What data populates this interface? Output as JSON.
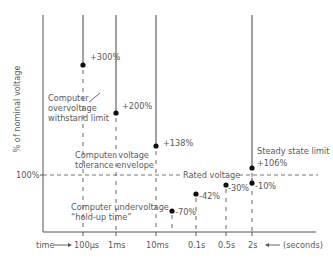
{
  "diagram": {
    "y_axis_label": "% of nominal voltage",
    "y_reference_label": "100%",
    "rated_voltage_label": "Rated voltage",
    "x_axis": {
      "prefix": "time",
      "suffix": "(seconds)",
      "ticks": [
        "100μs",
        "1ms",
        "10ms",
        "0.1s",
        "0.5s",
        "2s"
      ]
    },
    "overvoltage_points": [
      {
        "time": "100μs",
        "label": "+300%"
      },
      {
        "time": "1ms",
        "label": "+200%"
      },
      {
        "time": "10ms",
        "label": "+138%"
      },
      {
        "time": "2s",
        "label": "+106%"
      }
    ],
    "undervoltage_points": [
      {
        "time": "~20ms",
        "label": "-70%"
      },
      {
        "time": "0.1s",
        "label": "-42%"
      },
      {
        "time": "0.5s",
        "label": "-30%"
      },
      {
        "time": "2s",
        "label": "-10%"
      }
    ],
    "annotations": {
      "overvoltage_withstand": [
        "Computer",
        "overvoltage",
        "withstand limit"
      ],
      "tolerance_envelope": [
        "Computer voltage",
        "tolerance envelope"
      ],
      "undervoltage_holdup": [
        "Computer undervoltage",
        "“hold-up time”"
      ],
      "steady_state": "Steady state limit"
    },
    "colors": {
      "line": "#555555",
      "solid_line": "#444444",
      "dot": "#111111",
      "text": "#5a5a5a"
    }
  }
}
